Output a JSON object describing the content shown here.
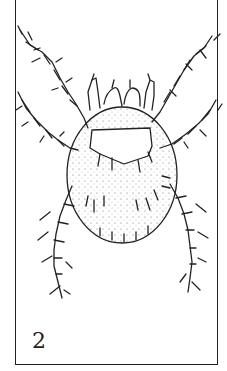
{
  "figure": {
    "number_label": "2",
    "ink_color": "#222222",
    "background_color": "#ffffff"
  }
}
